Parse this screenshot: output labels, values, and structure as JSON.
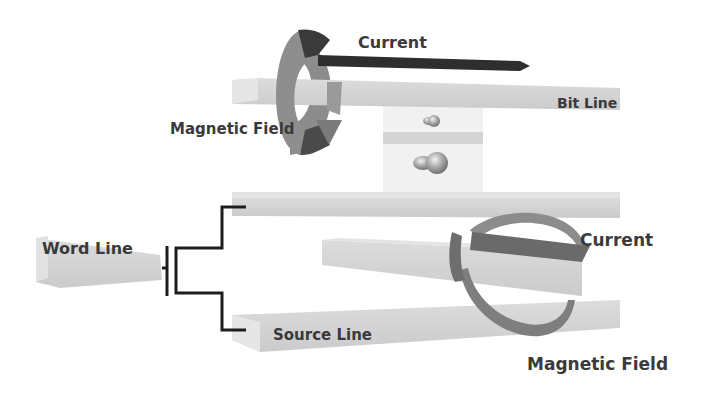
{
  "diagram": {
    "type": "MRAM cell schematic",
    "labels": {
      "current_top": "Current",
      "bit_line": "Bit Line",
      "magnetic_field_top": "Magnetic Field",
      "word_line": "Word Line",
      "current_bottom": "Current",
      "source_line": "Source Line",
      "magnetic_field_bottom": "Magnetic Field"
    },
    "colors": {
      "bar_fill": "#d6d6d6",
      "bar_side": "#c4c4c4",
      "ring": "#8a8a8a",
      "ring_dark": "#3c3c3c",
      "arrow": "#2e2e2e",
      "wire": "#1e1e1e",
      "text": "#3a3a3a"
    }
  }
}
